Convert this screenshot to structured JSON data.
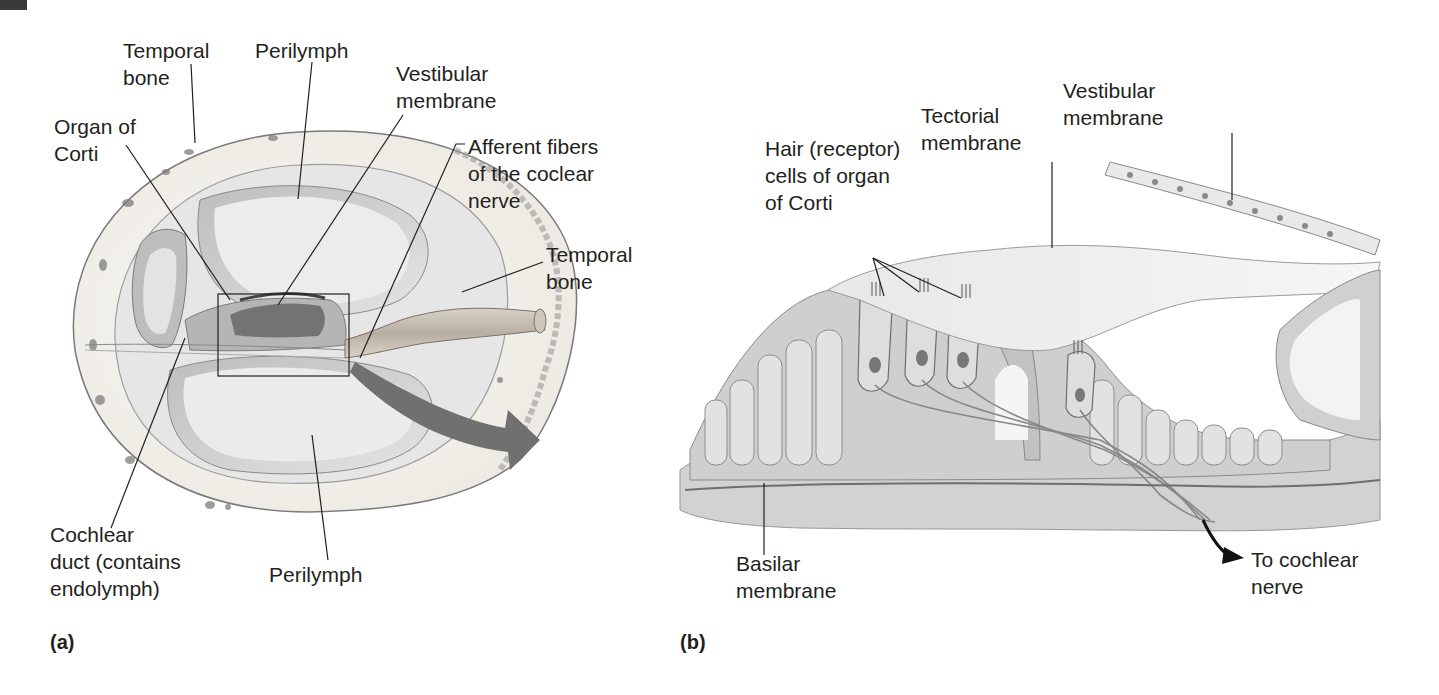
{
  "figure": {
    "panels": [
      {
        "tag": "(a)",
        "description": "Cross-section of the cochlea",
        "labels": {
          "temporal_bone_top": "Temporal\nbone",
          "perilymph_top": "Perilymph",
          "vestibular_membrane": "Vestibular\nmembrane",
          "organ_of_corti": "Organ of\nCorti",
          "afferent_fibers": "Afferent fibers\nof the coclear\nnerve",
          "temporal_bone_right": "Temporal\nbone",
          "cochlear_duct": "Cochlear\nduct (contains\nendolymph)",
          "perilymph_bottom": "Perilymph"
        }
      },
      {
        "tag": "(b)",
        "description": "Enlarged view of the organ of Corti",
        "labels": {
          "hair_cells": "Hair (receptor)\ncells of organ\nof Corti",
          "tectorial_membrane": "Tectorial\nmembrane",
          "vestibular_membrane": "Vestibular\nmembrane",
          "basilar_membrane": "Basilar\nmembrane",
          "to_cochlear_nerve": "To cochlear\nnerve"
        }
      }
    ],
    "colors": {
      "bone": "#f1efe9",
      "bone_edge": "#8c8c8c",
      "chamber": "#dcdcdc",
      "tissue": "#c9c9c9",
      "arrow": "#6e6e6e",
      "text": "#231f20"
    }
  }
}
